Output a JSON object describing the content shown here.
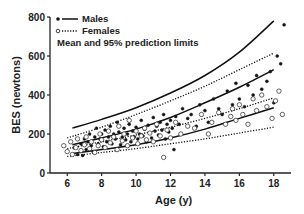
{
  "chart_data": {
    "type": "scatter",
    "title": "",
    "xlabel": "Age (y)",
    "ylabel": "BES (newtons)",
    "xlim": [
      5,
      19
    ],
    "ylim": [
      0,
      800
    ],
    "xticks": [
      6,
      8,
      10,
      12,
      14,
      16,
      18
    ],
    "yticks": [
      0,
      200,
      400,
      600,
      800
    ],
    "grid": false,
    "legend": {
      "placement": "top-left",
      "entries": [
        "Males",
        "Females"
      ],
      "note": "Mean and 95% prediction limits"
    },
    "series": [
      {
        "name": "Males",
        "marker": "filled-circle",
        "points": [
          [
            6.4,
            130
          ],
          [
            6.6,
            95
          ],
          [
            6.8,
            150
          ],
          [
            6.9,
            90
          ],
          [
            7.0,
            175
          ],
          [
            7.1,
            120
          ],
          [
            7.2,
            160
          ],
          [
            7.3,
            200
          ],
          [
            7.4,
            140
          ],
          [
            7.5,
            110
          ],
          [
            7.6,
            185
          ],
          [
            7.7,
            230
          ],
          [
            7.8,
            150
          ],
          [
            7.9,
            175
          ],
          [
            8.0,
            200
          ],
          [
            8.1,
            135
          ],
          [
            8.2,
            220
          ],
          [
            8.3,
            160
          ],
          [
            8.4,
            185
          ],
          [
            8.5,
            240
          ],
          [
            8.6,
            150
          ],
          [
            8.7,
            200
          ],
          [
            8.8,
            175
          ],
          [
            8.9,
            260
          ],
          [
            9.0,
            210
          ],
          [
            9.1,
            145
          ],
          [
            9.2,
            185
          ],
          [
            9.3,
            230
          ],
          [
            9.4,
            170
          ],
          [
            9.5,
            200
          ],
          [
            9.6,
            250
          ],
          [
            9.7,
            160
          ],
          [
            9.8,
            215
          ],
          [
            9.9,
            185
          ],
          [
            10.0,
            235
          ],
          [
            10.1,
            175
          ],
          [
            10.2,
            200
          ],
          [
            10.3,
            270
          ],
          [
            10.4,
            190
          ],
          [
            10.5,
            225
          ],
          [
            10.6,
            160
          ],
          [
            10.7,
            245
          ],
          [
            10.8,
            205
          ],
          [
            10.9,
            180
          ],
          [
            11.0,
            285
          ],
          [
            11.1,
            215
          ],
          [
            11.2,
            240
          ],
          [
            11.3,
            195
          ],
          [
            11.4,
            260
          ],
          [
            11.5,
            220
          ],
          [
            11.6,
            300
          ],
          [
            11.7,
            175
          ],
          [
            11.8,
            250
          ],
          [
            11.9,
            210
          ],
          [
            12.0,
            270
          ],
          [
            12.1,
            230
          ],
          [
            12.2,
            120
          ],
          [
            12.3,
            290
          ],
          [
            12.5,
            250
          ],
          [
            12.7,
            330
          ],
          [
            13.0,
            280
          ],
          [
            13.2,
            300
          ],
          [
            13.5,
            240
          ],
          [
            13.7,
            350
          ],
          [
            14.0,
            320
          ],
          [
            14.2,
            260
          ],
          [
            14.5,
            380
          ],
          [
            14.8,
            330
          ],
          [
            15.0,
            300
          ],
          [
            15.3,
            420
          ],
          [
            15.6,
            350
          ],
          [
            15.8,
            460
          ],
          [
            16.0,
            380
          ],
          [
            16.3,
            340
          ],
          [
            16.5,
            450
          ],
          [
            16.8,
            400
          ],
          [
            17.0,
            500
          ],
          [
            17.3,
            430
          ],
          [
            17.6,
            470
          ],
          [
            17.8,
            520
          ],
          [
            18.0,
            360
          ],
          [
            18.2,
            600
          ],
          [
            18.4,
            560
          ],
          [
            18.6,
            760
          ]
        ]
      },
      {
        "name": "Females",
        "marker": "open-circle",
        "points": [
          [
            5.8,
            140
          ],
          [
            6.0,
            110
          ],
          [
            6.2,
            160
          ],
          [
            6.3,
            95
          ],
          [
            6.5,
            130
          ],
          [
            6.6,
            175
          ],
          [
            6.8,
            115
          ],
          [
            7.0,
            145
          ],
          [
            7.1,
            185
          ],
          [
            7.3,
            125
          ],
          [
            7.4,
            160
          ],
          [
            7.6,
            105
          ],
          [
            7.8,
            140
          ],
          [
            7.9,
            200
          ],
          [
            8.0,
            170
          ],
          [
            8.2,
            130
          ],
          [
            8.4,
            215
          ],
          [
            8.5,
            155
          ],
          [
            8.7,
            185
          ],
          [
            8.9,
            120
          ],
          [
            9.0,
            240
          ],
          [
            9.2,
            165
          ],
          [
            9.3,
            200
          ],
          [
            9.5,
            140
          ],
          [
            9.6,
            270
          ],
          [
            9.8,
            180
          ],
          [
            10.0,
            215
          ],
          [
            10.1,
            150
          ],
          [
            10.3,
            190
          ],
          [
            10.5,
            230
          ],
          [
            10.6,
            170
          ],
          [
            10.8,
            205
          ],
          [
            11.0,
            160
          ],
          [
            11.2,
            250
          ],
          [
            11.4,
            190
          ],
          [
            11.6,
            80
          ],
          [
            11.8,
            220
          ],
          [
            12.0,
            180
          ],
          [
            12.3,
            260
          ],
          [
            12.6,
            200
          ],
          [
            13.0,
            240
          ],
          [
            13.4,
            230
          ],
          [
            13.8,
            300
          ],
          [
            14.2,
            200
          ],
          [
            14.4,
            260
          ],
          [
            14.8,
            310
          ],
          [
            15.2,
            250
          ],
          [
            15.5,
            290
          ],
          [
            15.6,
            330
          ],
          [
            15.8,
            270
          ],
          [
            16.0,
            350
          ],
          [
            16.2,
            300
          ],
          [
            16.5,
            250
          ],
          [
            16.8,
            380
          ],
          [
            17.0,
            320
          ],
          [
            17.3,
            400
          ],
          [
            17.6,
            340
          ],
          [
            17.9,
            280
          ],
          [
            18.1,
            370
          ],
          [
            18.3,
            420
          ],
          [
            18.5,
            300
          ]
        ]
      }
    ],
    "curves": [
      {
        "name": "Males upper 95% limit",
        "style": "solid",
        "x": [
          6.3,
          8,
          10,
          12,
          14,
          16,
          18
        ],
        "y": [
          230,
          275,
          335,
          410,
          500,
          620,
          780
        ]
      },
      {
        "name": "Males mean",
        "style": "solid",
        "x": [
          6.3,
          8,
          10,
          12,
          14,
          16,
          18
        ],
        "y": [
          145,
          180,
          225,
          285,
          360,
          440,
          530
        ]
      },
      {
        "name": "Males lower 95% limit",
        "style": "solid",
        "x": [
          6.3,
          8,
          10,
          12,
          14,
          16,
          18
        ],
        "y": [
          100,
          120,
          145,
          180,
          225,
          280,
          335
        ]
      },
      {
        "name": "Females upper 95% limit",
        "style": "dotted",
        "x": [
          6,
          8,
          10,
          12,
          14,
          16,
          18
        ],
        "y": [
          180,
          235,
          300,
          370,
          445,
          530,
          615
        ]
      },
      {
        "name": "Females mean",
        "style": "dotted",
        "x": [
          6,
          8,
          10,
          12,
          14,
          16,
          18
        ],
        "y": [
          125,
          160,
          195,
          235,
          280,
          330,
          385
        ]
      },
      {
        "name": "Females lower 95% limit",
        "style": "dotted",
        "x": [
          6,
          8,
          10,
          12,
          14,
          16,
          18
        ],
        "y": [
          85,
          105,
          125,
          150,
          175,
          205,
          235
        ]
      }
    ]
  }
}
